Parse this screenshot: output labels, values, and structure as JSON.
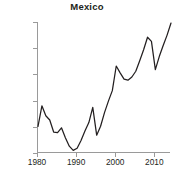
{
  "chart_data": {
    "type": "line",
    "title": "Mexico",
    "xlabel": "",
    "ylabel": "",
    "xlim": [
      1980,
      2014
    ],
    "ylim": [
      60000,
      85000
    ],
    "grid": false,
    "legend": null,
    "x_ticks": [
      1980,
      1990,
      2000,
      2010
    ],
    "x_tick_labels": [
      "1980",
      "1990",
      "2000",
      "2010"
    ],
    "y_ticks": [
      60000,
      65000,
      70000,
      75000,
      80000,
      85000
    ],
    "y_tick_labels": [
      "60,000",
      "65,000",
      "70,000",
      "75,000",
      "80,000",
      "85,000"
    ],
    "line_color": "#231f20",
    "x": [
      1980,
      1981,
      1982,
      1983,
      1984,
      1985,
      1986,
      1987,
      1988,
      1989,
      1990,
      1991,
      1992,
      1993,
      1994,
      1995,
      1996,
      1997,
      1998,
      1999,
      2000,
      2001,
      2002,
      2003,
      2004,
      2005,
      2006,
      2007,
      2008,
      2009,
      2010,
      2011,
      2012,
      2013,
      2014
    ],
    "values": [
      65100,
      69000,
      67100,
      66300,
      64000,
      63900,
      64800,
      62900,
      61300,
      60500,
      60900,
      62400,
      64200,
      65800,
      68700,
      63400,
      65100,
      67700,
      69900,
      71900,
      76600,
      75300,
      74100,
      73900,
      74500,
      75600,
      77600,
      79700,
      82100,
      81300,
      75900,
      78400,
      80500,
      82500,
      84800
    ],
    "series": [
      {
        "name": "Mexico",
        "values": [
          65100,
          69000,
          67100,
          66300,
          64000,
          63900,
          64800,
          62900,
          61300,
          60500,
          60900,
          62400,
          64200,
          65800,
          68700,
          63400,
          65100,
          67700,
          69900,
          71900,
          76600,
          75300,
          74100,
          73900,
          74500,
          75600,
          77600,
          79700,
          82100,
          81300,
          75900,
          78400,
          80500,
          82500,
          84800
        ]
      }
    ]
  }
}
